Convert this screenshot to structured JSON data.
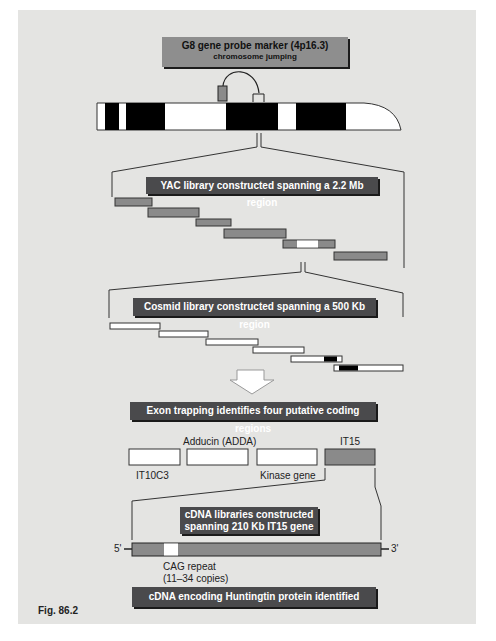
{
  "figure_label": "Fig. 86.2",
  "colors": {
    "background": "#e4e4e2",
    "box_light": "#8e8e8e",
    "box_dark": "#4a4a4c",
    "segment_gray": "#8a8a8a",
    "band_black": "#000000",
    "band_white": "#ffffff"
  },
  "steps": {
    "probe": {
      "title": "G8 gene probe marker (4p16.3)",
      "subtitle": "chromosome jumping"
    },
    "yac": {
      "title": "YAC library constructed spanning a 2.2 Mb region"
    },
    "cosmid": {
      "title": "Cosmid library constructed spanning a 500 Kb region"
    },
    "exon": {
      "title": "Exon trapping identifies four putative coding regions"
    },
    "cdna": {
      "title": "cDNA libraries constructed",
      "subtitle": "spanning 210 Kb IT15 gene"
    },
    "result": {
      "title": "cDNA encoding Huntingtin protein identified"
    }
  },
  "coding_regions": [
    {
      "label": "IT10C3",
      "label_position": "below",
      "fill": "white"
    },
    {
      "label": "Adducin (ADDA)",
      "label_position": "above",
      "fill": "white"
    },
    {
      "label": "Kinase gene",
      "label_position": "below",
      "fill": "white"
    },
    {
      "label": "IT15",
      "label_position": "above",
      "fill": "gray"
    }
  ],
  "gene": {
    "five_prime": "5'",
    "three_prime": "3'",
    "repeat_label": "CAG repeat",
    "repeat_copies": "(11–34 copies)"
  },
  "chromosome_bands": [
    "white",
    "black",
    "white",
    "black",
    "white",
    "black",
    "white",
    "black",
    "white-telomere"
  ],
  "yac_clones": 6,
  "cosmid_clones": 6
}
